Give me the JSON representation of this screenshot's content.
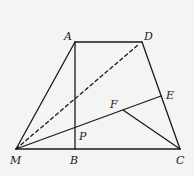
{
  "diagram": {
    "type": "geometry",
    "points": {
      "A": {
        "label": "A",
        "x": 75,
        "y": 42
      },
      "D": {
        "label": "D",
        "x": 142,
        "y": 42
      },
      "M": {
        "label": "M",
        "x": 16,
        "y": 149
      },
      "B": {
        "label": "B",
        "x": 75,
        "y": 149
      },
      "C": {
        "label": "C",
        "x": 180,
        "y": 149
      },
      "E": {
        "label": "E",
        "x": 161,
        "y": 96
      },
      "F": {
        "label": "F",
        "x": 123,
        "y": 110
      },
      "P": {
        "label": "P",
        "x": 75,
        "y": 127
      }
    },
    "segments": [
      {
        "from": "A",
        "to": "D",
        "style": "solid"
      },
      {
        "from": "M",
        "to": "A",
        "style": "solid"
      },
      {
        "from": "D",
        "to": "C",
        "style": "solid"
      },
      {
        "from": "M",
        "to": "C",
        "style": "solid"
      },
      {
        "from": "A",
        "to": "B",
        "style": "solid"
      },
      {
        "from": "M",
        "to": "E",
        "style": "solid"
      },
      {
        "from": "F",
        "to": "C",
        "style": "solid"
      },
      {
        "from": "M",
        "to": "D",
        "style": "dashed"
      }
    ],
    "labels": {
      "A": "A",
      "D": "D",
      "M": "M",
      "B": "B",
      "C": "C",
      "E": "E",
      "F": "F",
      "P": "P"
    }
  }
}
